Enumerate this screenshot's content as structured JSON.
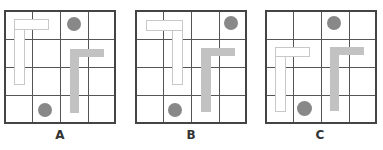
{
  "figure": {
    "panels": [
      {
        "id": "A",
        "label": "A",
        "grid_left": 4,
        "outline_L": "corner top-left, horizontal bar extends right from top of vertical bar (Γ shape)",
        "filled_L": "Γ shape, right-center",
        "dots": [
          "top row, column 3",
          "bottom row, column 2"
        ]
      },
      {
        "id": "B",
        "label": "B",
        "grid_left": 135,
        "outline_L": "corner top-right, horizontal bar extends left from top of vertical bar (mirrored ⅂ shape)",
        "filled_L": "Γ shape, right-center",
        "dots": [
          "top row, column 4",
          "bottom row, column 2"
        ]
      },
      {
        "id": "C",
        "label": "C",
        "grid_left": 265,
        "outline_L": "Γ shape, shifted down one row",
        "filled_L": "Γ shape, right-center",
        "dots": [
          "top row, column 3",
          "bottom row, column 2"
        ]
      }
    ],
    "grid_size": "4x4",
    "colors": {
      "grid_line": "#444444",
      "outline_shape_border": "#c8c8c8",
      "filled_shape": "#c2c2c2",
      "dot": "#888888"
    }
  }
}
